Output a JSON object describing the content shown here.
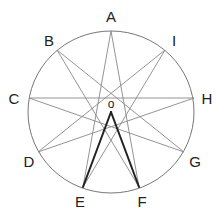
{
  "diagram": {
    "type": "nonagram-star-in-circle",
    "circle": {
      "cx": 111,
      "cy": 112,
      "rx": 83,
      "ry": 81,
      "stroke": "#777777"
    },
    "star_stroke": "#888888",
    "highlight_stroke": "#222222",
    "points": [
      {
        "label": "A",
        "x": 111,
        "y": 31,
        "lx": 111,
        "ly": 22
      },
      {
        "label": "B",
        "x": 57,
        "y": 50,
        "lx": 49,
        "ly": 46
      },
      {
        "label": "C",
        "x": 29,
        "y": 98,
        "lx": 14,
        "ly": 104
      },
      {
        "label": "D",
        "x": 38,
        "y": 152,
        "lx": 29,
        "ly": 167
      },
      {
        "label": "E",
        "x": 83,
        "y": 187,
        "lx": 80,
        "ly": 207
      },
      {
        "label": "F",
        "x": 139,
        "y": 187,
        "lx": 142,
        "ly": 207
      },
      {
        "label": "G",
        "x": 184,
        "y": 152,
        "lx": 195,
        "ly": 167
      },
      {
        "label": "H",
        "x": 194,
        "y": 98,
        "lx": 207,
        "ly": 104
      },
      {
        "label": "I",
        "x": 165,
        "y": 50,
        "lx": 174,
        "ly": 46
      }
    ],
    "star_edges": [
      [
        "A",
        "F"
      ],
      [
        "F",
        "B"
      ],
      [
        "B",
        "G"
      ],
      [
        "G",
        "C"
      ],
      [
        "C",
        "H"
      ],
      [
        "H",
        "D"
      ],
      [
        "D",
        "I"
      ],
      [
        "I",
        "E"
      ],
      [
        "E",
        "A"
      ]
    ],
    "center": {
      "label": "O",
      "x": 111,
      "y": 112,
      "lx": 111,
      "ly": 108
    },
    "highlight_edges": [
      [
        "O",
        "E"
      ],
      [
        "O",
        "F"
      ]
    ]
  }
}
